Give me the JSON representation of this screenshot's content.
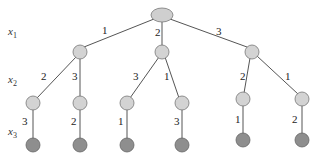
{
  "diagram": {
    "type": "tree",
    "row_labels": [
      {
        "var": "x",
        "sub": "1"
      },
      {
        "var": "x",
        "sub": "2"
      },
      {
        "var": "x",
        "sub": "3"
      }
    ],
    "level1_edges": [
      "1",
      "2",
      "3"
    ],
    "level2_edges": [
      "2",
      "3",
      "3",
      "1",
      "2",
      "1"
    ],
    "level3_edges": [
      "3",
      "2",
      "1",
      "3",
      "1",
      "2"
    ],
    "paths": [
      [
        1,
        2,
        3
      ],
      [
        1,
        3,
        2
      ],
      [
        2,
        3,
        1
      ],
      [
        2,
        1,
        3
      ],
      [
        3,
        2,
        1
      ],
      [
        3,
        1,
        2
      ]
    ],
    "colors": {
      "root_fill": "#cfcfcf",
      "internal_fill": "#d3d3d3",
      "leaf_fill": "#8e8e8e",
      "edge": "#555555"
    }
  }
}
